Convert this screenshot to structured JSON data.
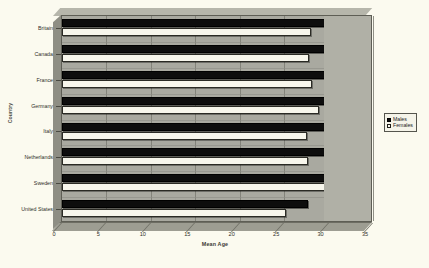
{
  "chart_data": {
    "type": "bar",
    "orientation": "horizontal",
    "title": "",
    "xlabel": "Mean Age",
    "ylabel": "Country",
    "xlim": [
      0,
      35
    ],
    "xticks": [
      0,
      5,
      10,
      15,
      20,
      25,
      30,
      35
    ],
    "grid": true,
    "legend_position": "right",
    "categories": [
      "Britain",
      "Canada",
      "France",
      "Germany",
      "Italy",
      "Netherlands",
      "Sweden",
      "United States"
    ],
    "series": [
      {
        "name": "Males",
        "color": "#0d0d0d",
        "values": [
          30.6,
          30.0,
          30.1,
          31.6,
          30.2,
          30.4,
          32.2,
          27.7
        ]
      },
      {
        "name": "Females",
        "color": "#f7f6ec",
        "values": [
          28.0,
          27.8,
          28.1,
          28.9,
          27.6,
          27.7,
          29.6,
          25.2
        ]
      }
    ]
  },
  "legend": {
    "items": [
      {
        "label": "Males"
      },
      {
        "label": "Females"
      }
    ]
  },
  "caption": "",
  "colors": {
    "page_background": "#fbfaef",
    "plot_background": "#a9a9a0",
    "plot_border": "#5e5e55",
    "gridline": "#7d7d73",
    "males_bar": "#0d0d0d",
    "females_bar": "#f7f6ec",
    "text": "#2e2e28"
  }
}
